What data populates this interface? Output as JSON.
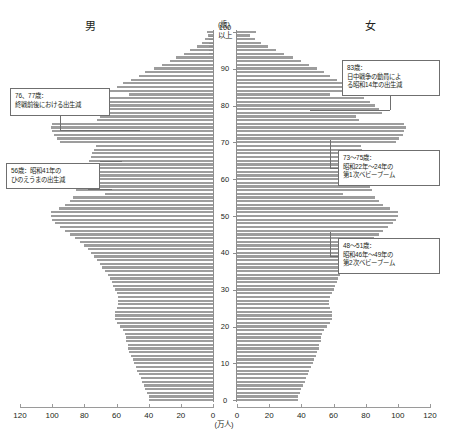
{
  "title_cut": "",
  "labels": {
    "male": "男",
    "female": "女",
    "age_unit": "(歳)",
    "population_unit": "(万人)",
    "top_age": "100",
    "top_age_suffix": "以上"
  },
  "annotations": [
    {
      "id": "male-76-77",
      "side": "left",
      "age_focus": [
        76,
        77
      ],
      "lines": [
        "76、77歳：",
        "終戦前後における出生減"
      ]
    },
    {
      "id": "male-56",
      "side": "left",
      "age_focus": [
        56
      ],
      "lines": [
        "56歳：昭和41年の",
        "ひのえうまの出生減"
      ]
    },
    {
      "id": "female-83",
      "side": "right",
      "age_focus": [
        83
      ],
      "lines": [
        "83歳：",
        "日中戦争の動員によ",
        "る昭和14年の出生減"
      ]
    },
    {
      "id": "female-73-75",
      "side": "right",
      "age_focus": [
        73,
        74,
        75
      ],
      "lines": [
        "73～75歳：",
        "昭和22年～24年の",
        "第1次ベビーブーム"
      ]
    },
    {
      "id": "female-48-51",
      "side": "right",
      "age_focus": [
        48,
        49,
        50,
        51
      ],
      "lines": [
        "48～51歳：",
        "昭和46年～49年の",
        "第2次ベビーブーム"
      ]
    }
  ],
  "colors": {
    "bar": "#9d9d9d",
    "axis": "#8d8d8d",
    "text": "#231f20",
    "callout_border": "#6f6f6f"
  },
  "chart_data": {
    "type": "bar",
    "subtype": "population-pyramid",
    "title": "",
    "xlabel": "(万人)",
    "ylabel": "(歳)",
    "xlim": [
      0,
      120
    ],
    "xticks": [
      0,
      20,
      40,
      60,
      80,
      100,
      120
    ],
    "ylim": [
      0,
      100
    ],
    "yticks": [
      0,
      10,
      20,
      30,
      40,
      50,
      60,
      70,
      80,
      90,
      100
    ],
    "grid": false,
    "legend": false,
    "orientation": "horizontal",
    "ages": [
      0,
      1,
      2,
      3,
      4,
      5,
      6,
      7,
      8,
      9,
      10,
      11,
      12,
      13,
      14,
      15,
      16,
      17,
      18,
      19,
      20,
      21,
      22,
      23,
      24,
      25,
      26,
      27,
      28,
      29,
      30,
      31,
      32,
      33,
      34,
      35,
      36,
      37,
      38,
      39,
      40,
      41,
      42,
      43,
      44,
      45,
      46,
      47,
      48,
      49,
      50,
      51,
      52,
      53,
      54,
      55,
      56,
      57,
      58,
      59,
      60,
      61,
      62,
      63,
      64,
      65,
      66,
      67,
      68,
      69,
      70,
      71,
      72,
      73,
      74,
      75,
      76,
      77,
      78,
      79,
      80,
      81,
      82,
      83,
      84,
      85,
      86,
      87,
      88,
      89,
      90,
      91,
      92,
      93,
      94,
      95,
      96,
      97,
      98,
      99,
      100
    ],
    "series": [
      {
        "name": "男",
        "side": "left",
        "values": [
          40,
          40,
          41,
          42,
          43,
          44,
          45,
          46,
          47,
          48,
          49,
          50,
          51,
          52,
          53,
          53,
          54,
          54,
          55,
          56,
          58,
          60,
          61,
          61,
          61,
          60,
          59,
          59,
          59,
          60,
          61,
          62,
          63,
          64,
          65,
          67,
          69,
          70,
          72,
          74,
          76,
          78,
          80,
          83,
          86,
          89,
          92,
          95,
          98,
          100,
          101,
          101,
          96,
          92,
          89,
          87,
          67,
          85,
          84,
          83,
          82,
          81,
          80,
          79,
          78,
          77,
          76,
          75,
          74,
          73,
          95,
          97,
          99,
          100,
          101,
          100,
          72,
          70,
          85,
          83,
          80,
          76,
          72,
          52,
          64,
          60,
          56,
          51,
          46,
          42,
          37,
          32,
          27,
          23,
          18,
          14,
          10,
          7,
          5,
          3,
          4
        ]
      },
      {
        "name": "女",
        "side": "right",
        "values": [
          38,
          38,
          39,
          40,
          41,
          42,
          43,
          44,
          45,
          46,
          47,
          48,
          49,
          50,
          51,
          51,
          52,
          52,
          53,
          54,
          56,
          58,
          59,
          59,
          59,
          58,
          57,
          57,
          58,
          59,
          60,
          61,
          62,
          63,
          64,
          66,
          68,
          69,
          71,
          73,
          75,
          77,
          79,
          82,
          85,
          88,
          91,
          94,
          97,
          99,
          100,
          100,
          95,
          91,
          88,
          86,
          66,
          84,
          83,
          82,
          82,
          81,
          81,
          80,
          80,
          79,
          79,
          78,
          78,
          77,
          99,
          101,
          103,
          104,
          105,
          104,
          76,
          74,
          90,
          88,
          86,
          83,
          79,
          58,
          72,
          69,
          66,
          62,
          58,
          54,
          50,
          45,
          40,
          35,
          29,
          24,
          19,
          15,
          11,
          8,
          12
        ]
      }
    ]
  }
}
